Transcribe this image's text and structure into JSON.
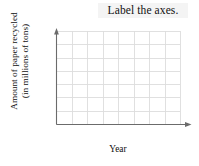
{
  "page": {
    "background_color": "#ffffff",
    "width": 199,
    "height": 166
  },
  "title": {
    "text": "Label the axes.",
    "highlight_color": "#f4f4f4",
    "text_color": "#111111"
  },
  "chart_data": {
    "type": "table",
    "title": "Label the axes.",
    "xlabel": "Year",
    "ylabel": "Amount of paper recycled (in millions of tons)",
    "ylabel_lines": [
      "Amount of paper recycled",
      "(in millions of tons)"
    ],
    "categories": [],
    "values": [],
    "series": [],
    "grid": true,
    "grid_columns": 8,
    "grid_rows": 7,
    "tick_labels_x": [],
    "tick_labels_y": [],
    "legend": [],
    "legend_position": "none",
    "annotations": [],
    "axis_color": "#6b6b6b",
    "grid_color": "#dcdcdc",
    "note": "Empty blank grid worksheet; no data plotted, axes unlabeled with tick values."
  },
  "axes": {
    "x_label": "Year",
    "y_label_line1": "Amount of paper recycled",
    "y_label_line2": "(in millions of tons)",
    "x_arrow": "arrow-right",
    "y_arrow": "arrow-up",
    "line_color": "#6b6b6b"
  },
  "grid": {
    "columns": 8,
    "rows": 7,
    "line_color": "#dcdcdc",
    "left": 56,
    "right": 180,
    "top": 31,
    "bottom": 124
  }
}
